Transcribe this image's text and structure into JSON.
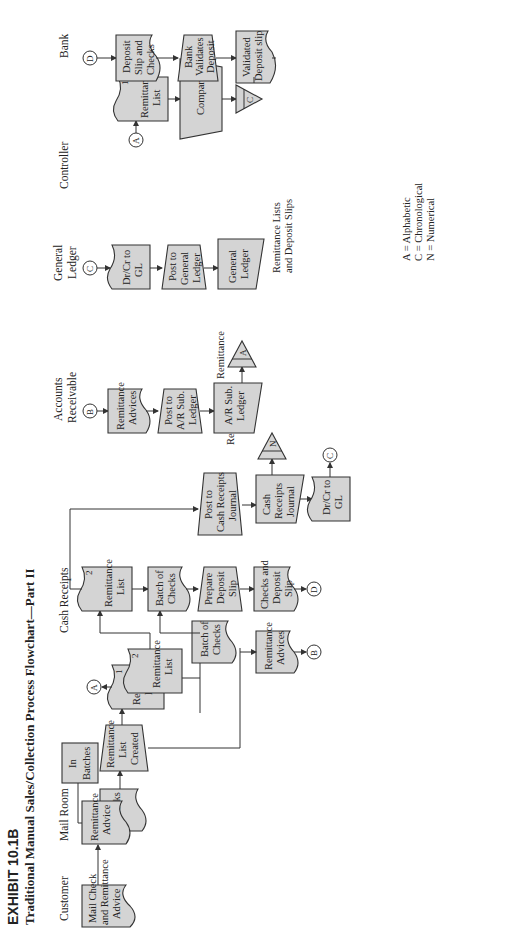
{
  "exhibit": {
    "number": "EXHIBIT 10.1B",
    "title": "Traditional Manual Sales/Collection Process Flowchart—Part II"
  },
  "lanes": {
    "customer": "Customer",
    "mail_room": "Mail Room",
    "cash_receipts": "Cash Receipts",
    "accounts_receivable_1": "Accounts",
    "accounts_receivable_2": "Receivable",
    "general_ledger_1": "General",
    "general_ledger_2": "Ledger",
    "controller": "Controller",
    "bank": "Bank"
  },
  "nodes": {
    "mail_check": [
      "Mail Check",
      "and Remittance",
      "Advice"
    ],
    "remittance_advice": [
      "Remittance",
      "Advice"
    ],
    "checks": [
      "Checks"
    ],
    "in_batches": [
      "In",
      "Batches"
    ],
    "remittance_list_created": [
      "Remittance",
      "List",
      "Created"
    ],
    "rl_copy1": [
      "Remittance",
      "List"
    ],
    "rl_copy1_num": "1",
    "rl_copy2": [
      "Remittance",
      "List"
    ],
    "rl_copy2_num": "2",
    "batch_of_checks_mr": [
      "Batch of",
      "Checks"
    ],
    "remittance_advices_mr": [
      "Remittance",
      "Advices"
    ],
    "cr_remittance_list": [
      "Remittance",
      "List"
    ],
    "cr_remittance_list_num": "2",
    "cr_batch_of_checks": [
      "Batch of",
      "Checks"
    ],
    "prepare_deposit_slip": [
      "Prepare",
      "Deposit",
      "Slip"
    ],
    "checks_and_deposit_slip": [
      "Checks and",
      "Deposit",
      "Slip"
    ],
    "post_to_crj": [
      "Post to",
      "Cash Receipts",
      "Journal"
    ],
    "crj": [
      "Cash",
      "Receipts",
      "Journal"
    ],
    "drcr_gl_cr": [
      "Dr/Cr to",
      "GL"
    ],
    "ar_remittance_advices": [
      "Remittance",
      "Advices"
    ],
    "post_to_ar": [
      "Post to",
      "A/R Sub.",
      "Ledger"
    ],
    "ar_sub_ledger": [
      "A/R Sub.",
      "Ledger"
    ],
    "gl_drcr": [
      "Dr/Cr to",
      "GL"
    ],
    "post_to_gl": [
      "Post to",
      "General",
      "Ledger"
    ],
    "general_ledger": [
      "General",
      "Ledger"
    ],
    "ctrl_remittance_list": [
      "Remittance",
      "List"
    ],
    "ctrl_remittance_list_num": "1",
    "compare": [
      "Compare"
    ],
    "deposit_slip_checks": [
      "Deposit",
      "Slip and",
      "Checks"
    ],
    "bank_validates": [
      "Bank",
      "Validates",
      "Deposit"
    ],
    "validated_slip": [
      "Validated",
      "Deposit slip"
    ]
  },
  "files": {
    "ar_file": {
      "letter": "A",
      "caption": [
        "Remittance",
        "Advices"
      ]
    },
    "crj_file": {
      "letter": "N",
      "caption": [
        "Remittance",
        "Lists"
      ]
    },
    "gl_caption": [
      "Remittance Lists",
      "and Deposit Slips"
    ],
    "ctrl_file": {
      "letter": "C"
    }
  },
  "connectors": {
    "a_out": "A",
    "b_out": "B",
    "d_out": "D",
    "c_out": "C",
    "b_in": "B",
    "c_in": "C",
    "a_in": "A",
    "d_in": "D"
  },
  "legend": [
    "A = Alphabetic",
    "C = Chronological",
    "N = Numerical"
  ]
}
